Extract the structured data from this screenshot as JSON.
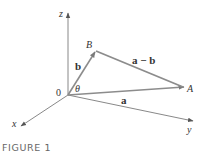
{
  "figure": {
    "caption": "FIGURE 1",
    "axes": {
      "x_label": "x",
      "y_label": "y",
      "z_label": "z",
      "origin_label": "0"
    },
    "points": {
      "A_label": "A",
      "B_label": "B"
    },
    "vectors": {
      "a_label": "a",
      "b_label": "b",
      "diff_label": "a − b"
    },
    "angle_label": "θ",
    "colors": {
      "vector_stroke": "#8c8c8c",
      "axis_stroke": "#7a7a7a",
      "text": "#333333",
      "caption": "#666666"
    }
  }
}
